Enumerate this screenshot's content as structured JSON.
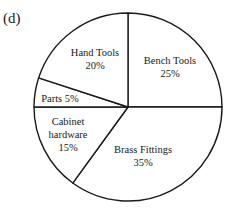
{
  "panel_label": "(d)",
  "chart_data": {
    "type": "pie",
    "title": "",
    "start_angle_deg": 90,
    "direction": "clockwise",
    "slices": [
      {
        "label": "Bench Tools",
        "value": 25,
        "display": [
          "Bench Tools",
          "25%"
        ]
      },
      {
        "label": "Brass Fittings",
        "value": 35,
        "display": [
          "Brass Fittings",
          "35%"
        ]
      },
      {
        "label": "Cabinet hardware",
        "value": 15,
        "display": [
          "Cabinet",
          "hardware",
          "15%"
        ]
      },
      {
        "label": "Parts",
        "value": 5,
        "display": [
          "Parts 5%"
        ]
      },
      {
        "label": "Hand Tools",
        "value": 20,
        "display": [
          "Hand Tools",
          "20%"
        ]
      }
    ],
    "units": "%",
    "legend": "none",
    "colors": {
      "fill": "#ffffff",
      "stroke": "#1a1a1a"
    }
  }
}
